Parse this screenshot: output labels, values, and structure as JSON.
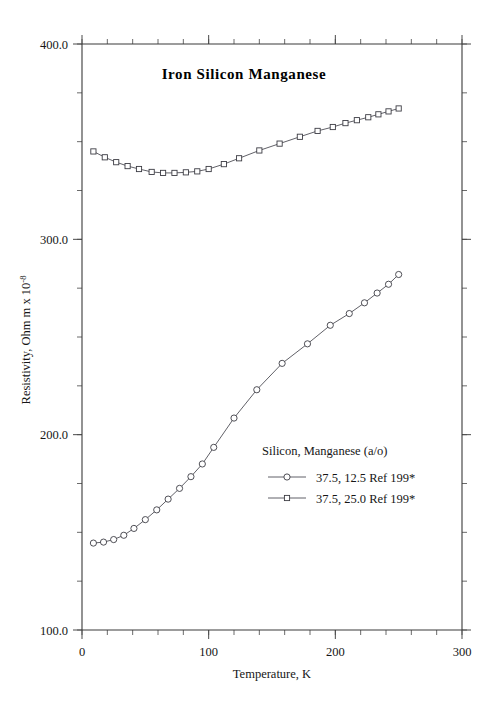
{
  "chart_data": {
    "type": "line",
    "title": "Iron Silicon Manganese",
    "xlabel": "Temperature,  K",
    "ylabel": "Resistivity, Ohm m x 10",
    "ylabel_exponent": "-8",
    "xlim": [
      0,
      300
    ],
    "ylim": [
      100.0,
      400.0
    ],
    "xticks": [
      0,
      100,
      200,
      300
    ],
    "xtick_labels": [
      "0",
      "100",
      "200",
      "300"
    ],
    "yticks": [
      100.0,
      200.0,
      300.0,
      400.0
    ],
    "ytick_labels": [
      "100.0",
      "200.0",
      "300.0",
      "400.0"
    ],
    "x_minor_step": 20,
    "y_minor_step": 25,
    "grid": false,
    "legend_position": "inside-lower-right",
    "legend_title": "Silicon, Manganese (a/o)",
    "series": [
      {
        "name": "37.5, 12.5 Ref 199*",
        "marker": "circle",
        "x": [
          9,
          17,
          25,
          33,
          41,
          50,
          59,
          68,
          77,
          86,
          95,
          104,
          120,
          138,
          158,
          178,
          196,
          211,
          223,
          233,
          242,
          250
        ],
        "y": [
          144.5,
          145.0,
          146.3,
          148.5,
          152.0,
          156.5,
          161.5,
          167.0,
          172.5,
          178.5,
          185.0,
          193.5,
          208.5,
          223.0,
          236.5,
          246.5,
          256.0,
          262.0,
          267.5,
          272.5,
          277.0,
          282.0
        ]
      },
      {
        "name": "37.5, 25.0 Ref 199*",
        "marker": "square",
        "x": [
          9,
          18,
          27,
          36,
          45,
          55,
          64,
          73,
          82,
          91,
          100,
          112,
          124,
          140,
          156,
          172,
          186,
          198,
          208,
          217,
          226,
          234,
          242,
          250
        ],
        "y": [
          345.0,
          342.0,
          339.5,
          337.5,
          336.0,
          334.5,
          334.0,
          334.0,
          334.3,
          334.8,
          336.0,
          338.5,
          341.5,
          345.5,
          349.0,
          352.5,
          355.5,
          357.5,
          359.5,
          361.0,
          362.5,
          364.0,
          365.5,
          367.0
        ]
      }
    ]
  },
  "figure": {
    "plot_left_px": 82,
    "plot_right_px": 462,
    "plot_top_px": 44,
    "plot_bottom_px": 630,
    "background_color": "#ffffff",
    "axis_color": "#3a3a3a",
    "series_color": "#4f4f57"
  }
}
